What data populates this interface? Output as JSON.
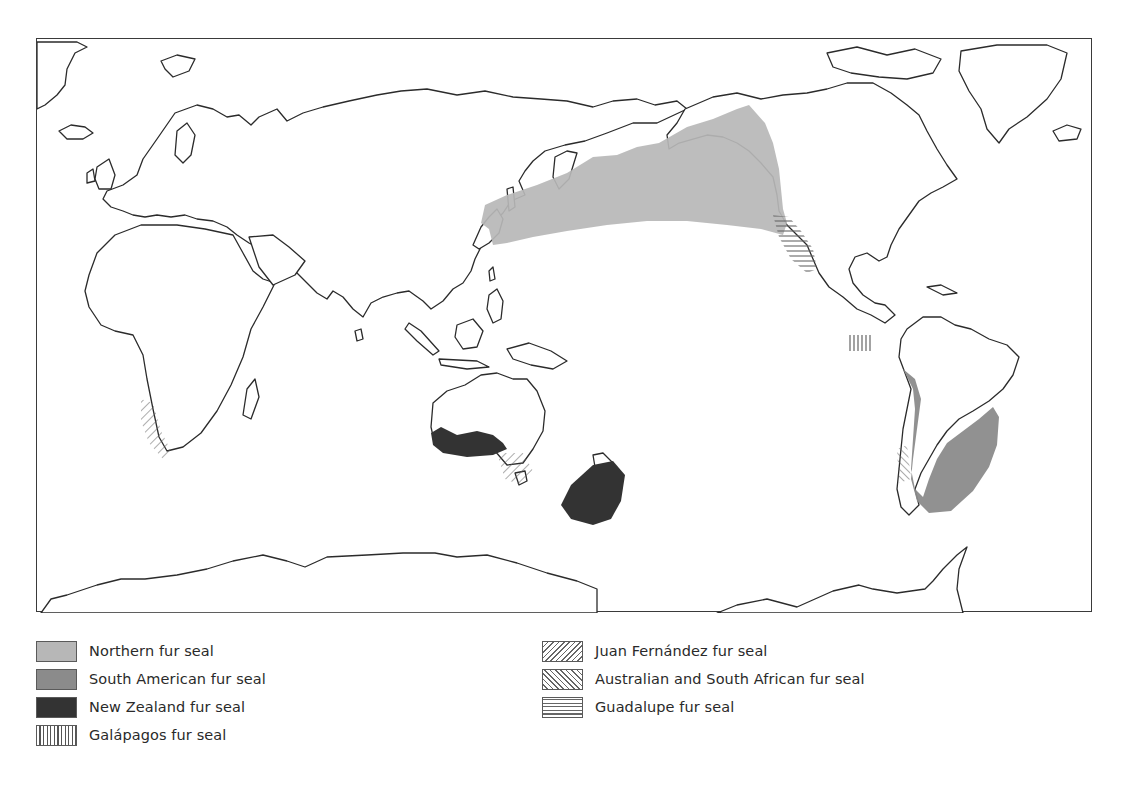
{
  "figure": {
    "projection": "Pacific-centred world map"
  },
  "colors": {
    "northern_fur_seal": "#b7b7b7",
    "south_american_fur_seal": "#8b8b8b",
    "new_zealand_fur_seal": "#333333",
    "coastline": "#2b2b2b",
    "frame": "#3a3a3a",
    "pattern_ink": "#666666"
  },
  "legend": {
    "left": [
      {
        "id": "northern",
        "label": "Northern fur seal",
        "pattern": "light-grey-fill"
      },
      {
        "id": "southam",
        "label": "South American fur seal",
        "pattern": "mid-grey-fill"
      },
      {
        "id": "nz",
        "label": "New Zealand fur seal",
        "pattern": "dark-fill"
      },
      {
        "id": "galapagos",
        "label": "Galápagos fur seal",
        "pattern": "vertical-lines"
      }
    ],
    "right": [
      {
        "id": "juan",
        "label": "Juan Fernández fur seal",
        "pattern": "diagonal-forward"
      },
      {
        "id": "austral",
        "label": "Australian and South African fur seal",
        "pattern": "diagonal-back"
      },
      {
        "id": "guadalupe",
        "label": "Guadalupe fur seal",
        "pattern": "horizontal-lines"
      }
    ]
  },
  "ranges": [
    {
      "species": "Northern fur seal",
      "region": "North Pacific – Japan, Kamchatka, Bering Sea, Alaska to California"
    },
    {
      "species": "Guadalupe fur seal",
      "region": "Baja California coast"
    },
    {
      "species": "Galápagos fur seal",
      "region": "Galápagos Islands"
    },
    {
      "species": "South American fur seal",
      "region": "Peru, Chile, Argentina, Uruguay, southern Brazil"
    },
    {
      "species": "Juan Fernández fur seal",
      "region": "Juan Fernández Islands off Chile"
    },
    {
      "species": "New Zealand fur seal",
      "region": "Southern and western Australia, New Zealand"
    },
    {
      "species": "Australian and South African fur seal",
      "region": "South-west Africa; Bass Strait, south-east Australia"
    }
  ]
}
